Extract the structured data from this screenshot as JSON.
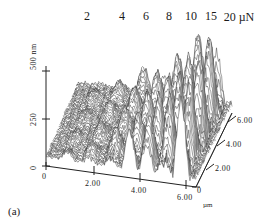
{
  "figure": {
    "caption": "(a)",
    "type": "afm-3d-surface-plot",
    "background_color": "#ffffff",
    "ink_color": "#1a1a1a"
  },
  "load_axis": {
    "name": "applied-load",
    "unit": "µN",
    "unit_label": "20 µN",
    "labels": [
      "2",
      "4",
      "6",
      "8",
      "10",
      "15",
      "20"
    ],
    "values": [
      2,
      4,
      6,
      8,
      10,
      15,
      20
    ]
  },
  "z_axis": {
    "name": "height",
    "unit": "nm",
    "top_label": "500 nm",
    "mid_label": "250",
    "zero_label": "0",
    "ticks": [
      0,
      250,
      500
    ],
    "range": [
      0,
      500
    ]
  },
  "x_axis": {
    "name": "scan-x",
    "unit": "µm",
    "unit_label": "µm",
    "ticks": [
      "0",
      "2.00",
      "4.00",
      "6.00"
    ],
    "values": [
      0,
      2,
      4,
      6
    ],
    "range": [
      0,
      7
    ]
  },
  "y_axis": {
    "name": "scan-y",
    "unit": "µm",
    "ticks": [
      "0",
      "2.00",
      "4.00",
      "6.00"
    ],
    "values": [
      0,
      2,
      4,
      6
    ],
    "range": [
      0,
      7
    ]
  },
  "chart_data": {
    "type": "line",
    "title": "",
    "subtitle": "",
    "xlabel": "µm",
    "ylabel": "500 nm",
    "zlabel": "µm",
    "xlim": [
      0,
      7
    ],
    "ylim": [
      0,
      500
    ],
    "grid": false,
    "legend_position": "none",
    "annotations": [
      "2",
      "4",
      "6",
      "8",
      "10",
      "15",
      "20 µN",
      "(a)"
    ],
    "load_positions_um": [
      1.0,
      2.0,
      3.0,
      3.9,
      4.7,
      5.5,
      6.3
    ],
    "series": [
      {
        "name": "2 µN",
        "load_uN": 2,
        "roughness_nm": 18,
        "peak_height_nm": 40
      },
      {
        "name": "4 µN",
        "load_uN": 4,
        "roughness_nm": 30,
        "peak_height_nm": 75
      },
      {
        "name": "6 µN",
        "load_uN": 6,
        "roughness_nm": 55,
        "peak_height_nm": 140
      },
      {
        "name": "8 µN",
        "load_uN": 8,
        "roughness_nm": 85,
        "peak_height_nm": 210
      },
      {
        "name": "10 µN",
        "load_uN": 10,
        "roughness_nm": 115,
        "peak_height_nm": 280
      },
      {
        "name": "15 µN",
        "load_uN": 15,
        "roughness_nm": 155,
        "peak_height_nm": 370
      },
      {
        "name": "20 µN",
        "load_uN": 20,
        "roughness_nm": 195,
        "peak_height_nm": 460
      }
    ]
  }
}
